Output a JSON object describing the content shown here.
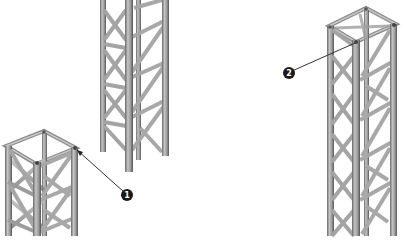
{
  "diagram": {
    "type": "truss-tower-illustration",
    "background": "#ffffff",
    "colors": {
      "chord_light": "#b8b8b8",
      "chord_mid": "#8f8f8f",
      "chord_dark": "#5a5a5a",
      "brace": "#9a9a9a",
      "callout_fill": "#1a1a1a",
      "leader_line": "#333333"
    },
    "towers": [
      {
        "id": "tower-left-short",
        "description": "Square truss section, top visible, cropped at bottom"
      },
      {
        "id": "tower-center-hanging",
        "description": "Truss section cropped at top, open bottom"
      },
      {
        "id": "tower-right-tall",
        "description": "Tall square truss section, top visible, cropped at bottom"
      }
    ],
    "callouts": [
      {
        "number": "1",
        "target": "top corner node of left tower"
      },
      {
        "number": "2",
        "target": "top corner node of right tower"
      }
    ]
  }
}
